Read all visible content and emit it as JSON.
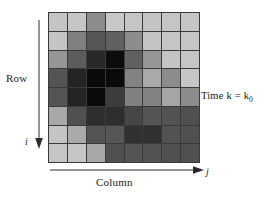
{
  "figure": {
    "row_axis_label": "Row",
    "row_index_symbol": "i",
    "column_axis_label": "Column",
    "column_index_symbol": "j",
    "time_label_prefix": "Time k = k",
    "time_label_subscript": "0",
    "grid_border_color": "#3a3a3a",
    "background_color": "#ffffff"
  },
  "chart_data": {
    "type": "heatmap",
    "title": "",
    "xlabel": "Column",
    "ylabel": "Row",
    "annotations": [
      "Time k = k0",
      "i",
      "j"
    ],
    "rows": 8,
    "cols": 8,
    "colormap": "grayscale",
    "value_range": [
      0,
      255
    ],
    "grid": true,
    "legend": "none",
    "values": [
      [
        196,
        198,
        140,
        200,
        198,
        196,
        197,
        198
      ],
      [
        196,
        128,
        86,
        96,
        140,
        196,
        198,
        197
      ],
      [
        150,
        92,
        40,
        12,
        96,
        150,
        196,
        197
      ],
      [
        84,
        36,
        10,
        10,
        130,
        170,
        140,
        198
      ],
      [
        84,
        36,
        10,
        60,
        128,
        130,
        165,
        140
      ],
      [
        168,
        80,
        46,
        46,
        70,
        84,
        82,
        80
      ],
      [
        196,
        170,
        84,
        86,
        48,
        48,
        82,
        80
      ],
      [
        197,
        198,
        168,
        80,
        84,
        82,
        80,
        80
      ]
    ],
    "colors": [
      [
        "#c4c4c4",
        "#c6c6c6",
        "#8c8c8c",
        "#c8c8c8",
        "#c6c6c6",
        "#c4c4c4",
        "#c5c5c5",
        "#c6c6c6"
      ],
      [
        "#c4c4c4",
        "#808080",
        "#565656",
        "#606060",
        "#8c8c8c",
        "#c4c4c4",
        "#c6c6c6",
        "#c5c5c5"
      ],
      [
        "#969696",
        "#5c5c5c",
        "#282828",
        "#0c0c0c",
        "#606060",
        "#969696",
        "#c4c4c4",
        "#c5c5c5"
      ],
      [
        "#545454",
        "#242424",
        "#0a0a0a",
        "#0a0a0a",
        "#828282",
        "#aaaaaa",
        "#8c8c8c",
        "#c6c6c6"
      ],
      [
        "#545454",
        "#242424",
        "#0a0a0a",
        "#3c3c3c",
        "#808080",
        "#828282",
        "#a5a5a5",
        "#8c8c8c"
      ],
      [
        "#a8a8a8",
        "#505050",
        "#2e2e2e",
        "#2e2e2e",
        "#464646",
        "#545454",
        "#525252",
        "#505050"
      ],
      [
        "#c4c4c4",
        "#aaaaaa",
        "#545454",
        "#565656",
        "#303030",
        "#303030",
        "#525252",
        "#505050"
      ],
      [
        "#c5c5c5",
        "#c6c6c6",
        "#a8a8a8",
        "#505050",
        "#545454",
        "#525252",
        "#505050",
        "#505050"
      ]
    ]
  }
}
